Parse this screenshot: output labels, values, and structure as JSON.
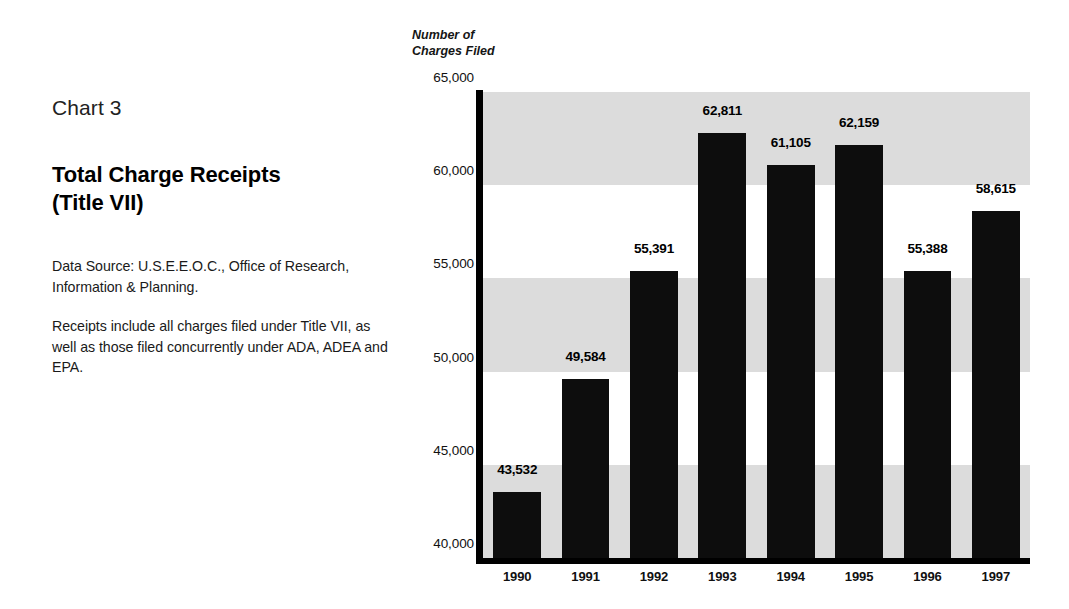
{
  "sidebar": {
    "chart_number": "Chart 3",
    "title_line1": "Total Charge Receipts",
    "title_line2": "(Title VII)",
    "notes": [
      "Data Source: U.S.E.E.O.C., Office of Research, Information & Planning.",
      "Receipts include all charges filed under Title VII, as well as those filed concurrently under ADA, ADEA and EPA."
    ]
  },
  "axis_caption": {
    "line1": "Number of",
    "line2": "Charges Filed"
  },
  "colors": {
    "bar": "#0d0d0d",
    "band_gray": "#dcdcdc",
    "band_white": "#ffffff",
    "axis": "#000000",
    "page_background": "#ffffff"
  },
  "chart_data": {
    "type": "bar",
    "title": "Total Charge Receipts (Title VII)",
    "subtitle": "Chart 3",
    "xlabel": "",
    "ylabel": "Number of Charges Filed",
    "categories": [
      "1990",
      "1991",
      "1992",
      "1993",
      "1994",
      "1995",
      "1996",
      "1997"
    ],
    "values": [
      43532,
      49584,
      55391,
      62811,
      61105,
      62159,
      55388,
      58615
    ],
    "value_labels": [
      "43,532",
      "49,584",
      "55,391",
      "62,811",
      "61,105",
      "62,159",
      "55,388",
      "58,615"
    ],
    "ylim": [
      40000,
      65000
    ],
    "yticks": [
      40000,
      45000,
      50000,
      55000,
      60000,
      65000
    ],
    "ytick_labels": [
      "40,000",
      "45,000",
      "50,000",
      "55,000",
      "60,000",
      "65,000"
    ],
    "grid": false,
    "banding": "alternating horizontal gray/white bands every 5,000 units",
    "legend": null,
    "legend_position": "none"
  }
}
